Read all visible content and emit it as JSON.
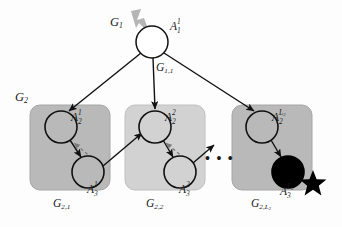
{
  "figure": {
    "colors": {
      "background": "#fdfdfd",
      "box_dark": "#b9b9b9",
      "box_light": "#d2d2d2",
      "box_border": "#a2a2a2",
      "node_stroke": "#111111",
      "node_fill_root": "#ffffff",
      "node_fill_filled": "#000000",
      "edge_solid": "#111111",
      "edge_dashed": "#7a7a7a",
      "pointer": "#b5b5b5",
      "star": "#000000",
      "text": "#1a1a1a"
    }
  },
  "labels": {
    "level1_group": {
      "base": "G",
      "sub": "1"
    },
    "root_node": {
      "base": "A",
      "sub": "1",
      "sup": "1"
    },
    "root_subgroup": {
      "base": "G",
      "sub": "1,1"
    },
    "level2_group": {
      "base": "G",
      "sub": "2"
    },
    "group1_caption": {
      "base": "G",
      "sub": "2,1"
    },
    "group2_caption": {
      "base": "G",
      "sub": "2,2"
    },
    "group3_caption": {
      "base": "G",
      "sub": "2,L",
      "sub2": "2"
    },
    "g1_top_node": {
      "base": "A",
      "sub": "2",
      "sup": "1"
    },
    "g1_bottom_node": {
      "base": "A",
      "sub": "3",
      "sup": "1"
    },
    "g2_top_node": {
      "base": "A",
      "sub": "2",
      "sup": "2"
    },
    "g2_bottom_node": {
      "base": "A",
      "sub": "3",
      "sup": "2"
    },
    "g3_top_node": {
      "base": "A",
      "sub": "2",
      "supA": "L",
      "supB": "2"
    },
    "g3_bottom_node": {
      "base": "A",
      "sub": "3",
      "supA": "L",
      "supB": "2"
    },
    "ellipsis": "• • •"
  },
  "graph_structure": {
    "nodes": [
      {
        "id": "A_1^1",
        "group": "root",
        "fill": "white",
        "cx": 152,
        "cy": 42,
        "r": 16
      },
      {
        "id": "A_2^1",
        "group": "G_2,1",
        "fill": "gray",
        "cx": 61,
        "cy": 127,
        "r": 16
      },
      {
        "id": "A_3^1",
        "group": "G_2,1",
        "fill": "gray",
        "cx": 88,
        "cy": 172,
        "r": 16
      },
      {
        "id": "A_2^2",
        "group": "G_2,2",
        "fill": "gray",
        "cx": 155,
        "cy": 127,
        "r": 16
      },
      {
        "id": "A_3^2",
        "group": "G_2,2",
        "fill": "gray",
        "cx": 180,
        "cy": 172,
        "r": 16
      },
      {
        "id": "A_2^L2",
        "group": "G_2,L_2",
        "fill": "gray",
        "cx": 262,
        "cy": 127,
        "r": 16
      },
      {
        "id": "A_3^L2",
        "group": "G_2,L_2",
        "fill": "black",
        "cx": 288,
        "cy": 172,
        "r": 16
      }
    ],
    "edges": [
      {
        "from": "A_1^1",
        "to": "A_2^1",
        "style": "solid"
      },
      {
        "from": "A_1^1",
        "to": "A_2^2",
        "style": "solid"
      },
      {
        "from": "A_1^1",
        "to": "A_2^L2",
        "style": "solid"
      },
      {
        "from": "A_2^1",
        "to": "A_3^1",
        "style": "solid"
      },
      {
        "from": "A_3^1",
        "to": "A_2^1",
        "style": "dashed"
      },
      {
        "from": "A_2^2",
        "to": "A_3^2",
        "style": "solid"
      },
      {
        "from": "A_3^2",
        "to": "A_2^2",
        "style": "dashed"
      },
      {
        "from": "A_3^1",
        "to": "A_2^2",
        "style": "solid"
      },
      {
        "from": "A_3^2",
        "to": "next",
        "style": "solid"
      },
      {
        "from": "A_2^L2",
        "to": "A_3^L2",
        "style": "solid"
      }
    ],
    "boxes": [
      {
        "id": "G_2,1",
        "shade": "dark",
        "x": 30,
        "y": 105,
        "w": 80,
        "h": 85
      },
      {
        "id": "G_2,2",
        "shade": "light",
        "x": 125,
        "y": 105,
        "w": 80,
        "h": 85
      },
      {
        "id": "G_2,L_2",
        "shade": "dark",
        "x": 232,
        "y": 105,
        "w": 80,
        "h": 85
      }
    ],
    "star_marker": {
      "cx": 313,
      "cy": 183,
      "r": 13
    }
  }
}
